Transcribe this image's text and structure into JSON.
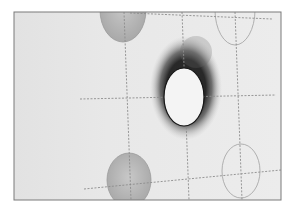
{
  "image": {
    "description": "Grayscale photo of paper with dashed grid lines and ellipses; central ellipse cut out as a hole with a dark scorch halo",
    "colors": {
      "background": "#ffffff",
      "paper": "#e6e6e6",
      "paper_light": "#ededed",
      "frame": "#7a7a7a",
      "dash": "#8c8c8c",
      "shaded_ellipse": "#b4b4b4",
      "outline_ellipse": "#a8a8a8",
      "hole": "#f4f4f4",
      "scorch": "#2a2a2a"
    }
  }
}
